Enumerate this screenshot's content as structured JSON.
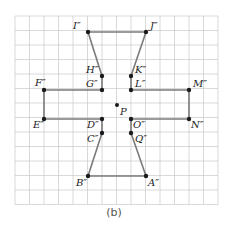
{
  "figure": {
    "caption": "(b)",
    "grid": {
      "x0": 15,
      "y0": 16,
      "cell": 14.5,
      "cols": 14,
      "rows": 13,
      "line_color": "#c8c8c8"
    },
    "shape_color": "#7a7a7a",
    "point_color": "#1a1a1a",
    "center": {
      "label": "P",
      "x": 117,
      "y": 105
    },
    "points": [
      {
        "label": "I″",
        "x": 88,
        "y": 32,
        "lx": 73,
        "ly": 29
      },
      {
        "label": "J″",
        "x": 146,
        "y": 32,
        "lx": 150,
        "ly": 29
      },
      {
        "label": "H″",
        "x": 102,
        "y": 76,
        "lx": 86,
        "ly": 73
      },
      {
        "label": "K″",
        "x": 131,
        "y": 76,
        "lx": 135,
        "ly": 73
      },
      {
        "label": "G″",
        "x": 102,
        "y": 90,
        "lx": 86,
        "ly": 87
      },
      {
        "label": "L″",
        "x": 131,
        "y": 90,
        "lx": 135,
        "ly": 87
      },
      {
        "label": "F″",
        "x": 44,
        "y": 90,
        "lx": 35,
        "ly": 86
      },
      {
        "label": "M″",
        "x": 189,
        "y": 90,
        "lx": 193,
        "ly": 87
      },
      {
        "label": "E″",
        "x": 44,
        "y": 119,
        "lx": 33,
        "ly": 128
      },
      {
        "label": "D″",
        "x": 102,
        "y": 119,
        "lx": 87,
        "ly": 128
      },
      {
        "label": "O″",
        "x": 131,
        "y": 119,
        "lx": 133,
        "ly": 128
      },
      {
        "label": "N″",
        "x": 189,
        "y": 119,
        "lx": 191,
        "ly": 128
      },
      {
        "label": "C″",
        "x": 102,
        "y": 133,
        "lx": 87,
        "ly": 142
      },
      {
        "label": "Q″",
        "x": 131,
        "y": 133,
        "lx": 135,
        "ly": 142
      },
      {
        "label": "B″",
        "x": 88,
        "y": 176,
        "lx": 76,
        "ly": 186
      },
      {
        "label": "A″",
        "x": 146,
        "y": 176,
        "lx": 148,
        "ly": 186
      }
    ],
    "segments": [
      [
        "I″",
        "J″"
      ],
      [
        "I″",
        "H″"
      ],
      [
        "H″",
        "G″"
      ],
      [
        "G″",
        "F″"
      ],
      [
        "F″",
        "E″"
      ],
      [
        "E″",
        "D″"
      ],
      [
        "D″",
        "C″"
      ],
      [
        "C″",
        "B″"
      ],
      [
        "B″",
        "A″"
      ],
      [
        "A″",
        "Q″"
      ],
      [
        "Q″",
        "O″"
      ],
      [
        "O″",
        "N″"
      ],
      [
        "N″",
        "M″"
      ],
      [
        "M″",
        "L″"
      ],
      [
        "L″",
        "K″"
      ],
      [
        "K″",
        "J″"
      ]
    ]
  }
}
